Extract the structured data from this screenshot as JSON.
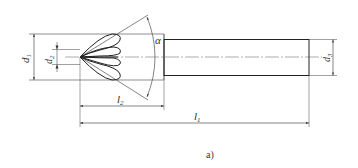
{
  "figure": {
    "caption": "a)",
    "labels": {
      "d1": "d",
      "d1_sub": "1",
      "d2": "d",
      "d2_sub": "2",
      "d3": "d",
      "d3_sub": "3",
      "l1": "l",
      "l1_sub": "1",
      "l2": "l",
      "l2_sub": "2",
      "alpha": "α"
    },
    "colors": {
      "line": "#333333",
      "thin": "#555555",
      "background": "#ffffff"
    }
  }
}
